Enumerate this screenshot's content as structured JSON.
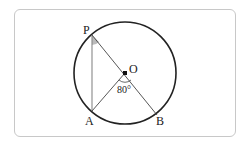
{
  "diagram": {
    "type": "circle-geometry",
    "circle": {
      "center_label": "O",
      "cx": 125,
      "cy": 73,
      "r": 51
    },
    "points": {
      "P": {
        "label": "P",
        "x": 92,
        "y": 35
      },
      "A": {
        "label": "A",
        "x": 92,
        "y": 111
      },
      "B": {
        "label": "B",
        "x": 157,
        "y": 115
      },
      "O": {
        "label": "O",
        "x": 125,
        "y": 73
      }
    },
    "segments": [
      "PA",
      "PB",
      "OA"
    ],
    "angle_label": "80°",
    "angle_at": "AOB",
    "marked_angle": "APB",
    "colors": {
      "stroke": "#222222",
      "frame": "#c8c8c8",
      "shade": "#bbbbbb",
      "chord": "#888888"
    }
  }
}
